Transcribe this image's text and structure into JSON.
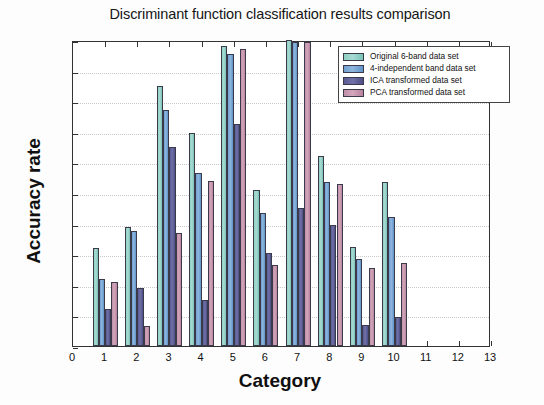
{
  "chart_data": {
    "type": "bar",
    "title": "Discriminant function classification results comparison",
    "xlabel": "Category",
    "ylabel": "Accuracy rate",
    "grid": true,
    "legend_position": "top-right",
    "xlim": [
      0,
      13
    ],
    "ylim": [
      0,
      1
    ],
    "xticks": [
      "0",
      "1",
      "2",
      "3",
      "4",
      "5",
      "6",
      "7",
      "8",
      "9",
      "10",
      "11",
      "12",
      "13"
    ],
    "yticks": [
      "0",
      "0.1",
      "0.2",
      "0.3",
      "0.4",
      "0.5",
      "0.6",
      "0.7",
      "0.8",
      "0.9",
      "1"
    ],
    "categories": [
      "1",
      "2",
      "3",
      "4",
      "5",
      "6",
      "7",
      "8",
      "9",
      "10"
    ],
    "series": [
      {
        "name": "Original 6-band data set",
        "color": "#8ecfc3",
        "values": [
          0.32,
          0.39,
          0.85,
          0.695,
          0.98,
          0.51,
          1.0,
          0.62,
          0.325,
          0.535
        ]
      },
      {
        "name": "4-independent band data set",
        "color": "#6f9fd0",
        "values": [
          0.22,
          0.375,
          0.77,
          0.565,
          0.955,
          0.435,
          0.995,
          0.535,
          0.285,
          0.42
        ]
      },
      {
        "name": "ICA transformed data set",
        "color": "#5a5a94",
        "values": [
          0.12,
          0.19,
          0.65,
          0.15,
          0.725,
          0.305,
          0.45,
          0.395,
          0.07,
          0.095
        ]
      },
      {
        "name": "PCA transformed data set",
        "color": "#c08fa8",
        "values": [
          0.21,
          0.065,
          0.37,
          0.54,
          0.97,
          0.265,
          0.995,
          0.53,
          0.255,
          0.27
        ]
      }
    ]
  }
}
